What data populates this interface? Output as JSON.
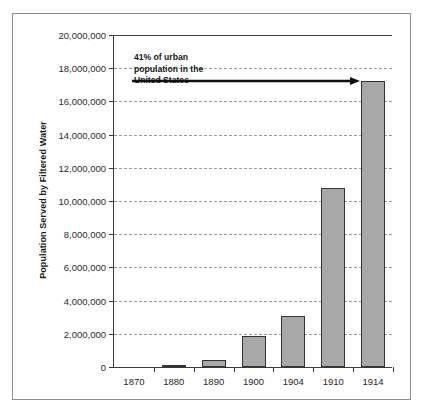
{
  "chart_data": {
    "type": "bar",
    "title": "",
    "subtitle": "",
    "xlabel": "",
    "ylabel": "Population Served by Filtered Water",
    "categories": [
      "1870",
      "1880",
      "1890",
      "1900",
      "1904",
      "1910",
      "1914"
    ],
    "values": [
      0,
      100000,
      400000,
      1850000,
      3050000,
      10800000,
      17200000
    ],
    "ylim": [
      0,
      20000000
    ],
    "ytick_labels": [
      "20,000,000",
      "18,000,000",
      "16,000,000",
      "14,000,000",
      "12,000,000",
      "10,000,000",
      "8,000,000",
      "6,000,000",
      "4,000,000",
      "2,000,000",
      "0"
    ],
    "ytick_values": [
      20000000,
      18000000,
      16000000,
      14000000,
      12000000,
      10000000,
      8000000,
      6000000,
      4000000,
      2000000,
      0
    ],
    "grid": true,
    "grid_style": "dashed-horizontal",
    "legend": "none",
    "bar_fill_color": "#a8a8a8",
    "bar_edge_color": "#333333",
    "annotations": [
      {
        "text": "41% of urban population in the United States",
        "lines": [
          "41% of urban",
          "population in the",
          "United States"
        ],
        "points_to_category": "1914",
        "points_to_value": 17200000,
        "arrow": "right-arrow"
      }
    ]
  }
}
